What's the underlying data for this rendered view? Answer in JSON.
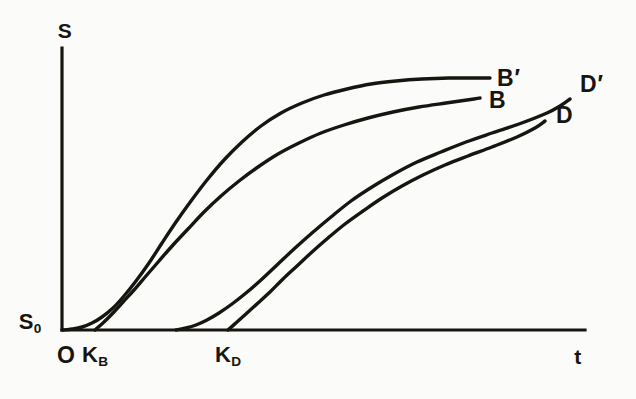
{
  "figure": {
    "background_color": "#fbfbf9",
    "ink_color": "#17150f"
  },
  "axes": {
    "y_axis_title": "S",
    "x_axis_title": "t",
    "origin_label": "O",
    "y_baseline_label_main": "S",
    "y_baseline_label_sub": "0"
  },
  "ticks": {
    "k_b_main": "K",
    "k_b_sub": "B",
    "k_d_main": "K",
    "k_d_sub": "D"
  },
  "series_labels": {
    "b_prime_main": "B",
    "b_prime_mark": "′",
    "b_main": "B",
    "d_prime_main": "D",
    "d_prime_mark": "′",
    "d_main": "D"
  },
  "chart_data": {
    "type": "line",
    "title": "",
    "xlabel": "t",
    "ylabel": "S",
    "grid": false,
    "legend": "inline-right-of-curve-ends",
    "xlim": [
      0,
      1
    ],
    "ylim": [
      0,
      1
    ],
    "axis_pixel_frame": {
      "origin_x": 62,
      "origin_y": 330,
      "x_axis_end_x": 585,
      "y_axis_top_y": 48
    },
    "annotations": [
      {
        "name": "S0",
        "text": "S₀",
        "meaning": "initial value of S on the ordinate",
        "pixel": [
          30,
          322
        ]
      },
      {
        "name": "O",
        "text": "O",
        "meaning": "origin",
        "pixel": [
          66,
          355
        ]
      },
      {
        "name": "KB",
        "text": "K_B",
        "meaning": "lag-time intercept of curve B tangent on t axis",
        "pixel": [
          95,
          355
        ]
      },
      {
        "name": "KD",
        "text": "K_D",
        "meaning": "lag-time intercept of curve D tangent on t axis",
        "pixel": [
          228,
          355
        ]
      }
    ],
    "series": [
      {
        "name": "B′",
        "description": "leftmost sigmoid, rises earliest from the origin and saturates highest",
        "label_pixel": [
          497,
          78
        ],
        "points_pixel": [
          [
            63,
            330
          ],
          [
            72,
            329
          ],
          [
            82,
            327
          ],
          [
            92,
            323
          ],
          [
            102,
            317
          ],
          [
            113,
            308
          ],
          [
            124,
            296
          ],
          [
            136,
            281
          ],
          [
            149,
            263
          ],
          [
            162,
            243
          ],
          [
            176,
            222
          ],
          [
            191,
            201
          ],
          [
            207,
            180
          ],
          [
            224,
            160
          ],
          [
            242,
            142
          ],
          [
            261,
            126
          ],
          [
            281,
            113
          ],
          [
            302,
            103
          ],
          [
            324,
            95
          ],
          [
            347,
            89
          ],
          [
            371,
            84
          ],
          [
            396,
            81
          ],
          [
            422,
            79
          ],
          [
            449,
            78
          ],
          [
            477,
            78
          ],
          [
            490,
            78
          ]
        ]
      },
      {
        "name": "B",
        "description": "tangent-shifted sigmoid starting at K_B, just right of and below B′",
        "label_pixel": [
          489,
          100
        ],
        "points_pixel": [
          [
            95,
            330
          ],
          [
            104,
            322
          ],
          [
            113,
            313
          ],
          [
            123,
            302
          ],
          [
            134,
            290
          ],
          [
            146,
            276
          ],
          [
            159,
            261
          ],
          [
            173,
            245
          ],
          [
            188,
            229
          ],
          [
            204,
            212
          ],
          [
            221,
            196
          ],
          [
            239,
            181
          ],
          [
            258,
            167
          ],
          [
            278,
            154
          ],
          [
            299,
            143
          ],
          [
            321,
            133
          ],
          [
            344,
            125
          ],
          [
            368,
            118
          ],
          [
            393,
            112
          ],
          [
            419,
            107
          ],
          [
            446,
            103
          ],
          [
            474,
            99
          ],
          [
            480,
            98
          ]
        ]
      },
      {
        "name": "D′",
        "description": "third sigmoid, delayed relative to B family, rises from near K_D region",
        "label_pixel": [
          580,
          84
        ],
        "points_pixel": [
          [
            176,
            330
          ],
          [
            186,
            328
          ],
          [
            196,
            325
          ],
          [
            207,
            320
          ],
          [
            219,
            313
          ],
          [
            232,
            304
          ],
          [
            246,
            293
          ],
          [
            261,
            280
          ],
          [
            277,
            265
          ],
          [
            294,
            249
          ],
          [
            312,
            233
          ],
          [
            331,
            217
          ],
          [
            351,
            201
          ],
          [
            372,
            187
          ],
          [
            394,
            174
          ],
          [
            417,
            162
          ],
          [
            441,
            152
          ],
          [
            466,
            142
          ],
          [
            492,
            133
          ],
          [
            519,
            124
          ],
          [
            547,
            113
          ],
          [
            560,
            106
          ],
          [
            570,
            99
          ]
        ]
      },
      {
        "name": "D",
        "description": "rightmost sigmoid, steep tangent intercepting t axis at K_D",
        "label_pixel": [
          556,
          115
        ],
        "points_pixel": [
          [
            228,
            330
          ],
          [
            237,
            322
          ],
          [
            247,
            313
          ],
          [
            258,
            303
          ],
          [
            270,
            292
          ],
          [
            283,
            279
          ],
          [
            297,
            266
          ],
          [
            312,
            252
          ],
          [
            328,
            238
          ],
          [
            345,
            224
          ],
          [
            363,
            211
          ],
          [
            382,
            198
          ],
          [
            402,
            186
          ],
          [
            423,
            175
          ],
          [
            445,
            165
          ],
          [
            468,
            156
          ],
          [
            492,
            147
          ],
          [
            517,
            137
          ],
          [
            535,
            128
          ],
          [
            545,
            121
          ]
        ]
      }
    ]
  }
}
